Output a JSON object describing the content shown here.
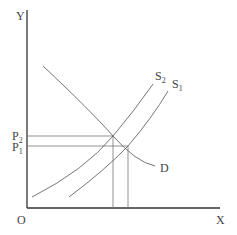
{
  "diagram": {
    "type": "supply-demand",
    "axes": {
      "y_label": "Y",
      "x_label": "X",
      "origin_label": "O"
    },
    "price_levels": [
      {
        "label": "P",
        "sub": "2"
      },
      {
        "label": "P",
        "sub": "1"
      }
    ],
    "curves": [
      {
        "name": "demand",
        "label": "D",
        "sub": ""
      },
      {
        "name": "supply-2",
        "label": "S",
        "sub": "2"
      },
      {
        "name": "supply-1",
        "label": "S",
        "sub": "1"
      }
    ],
    "colors": {
      "axis": "#333333",
      "curve": "#666666",
      "guide": "#777777",
      "text": "#444444"
    }
  }
}
